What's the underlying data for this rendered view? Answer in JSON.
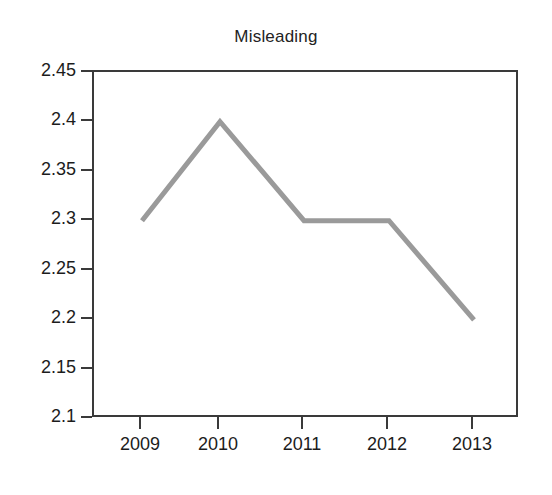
{
  "chart_data": {
    "type": "line",
    "title": "Misleading",
    "xlabel": "",
    "ylabel": "",
    "categories": [
      "2009",
      "2010",
      "2011",
      "2012",
      "2013"
    ],
    "values": [
      2.3,
      2.4,
      2.3,
      2.3,
      2.2
    ],
    "series": [
      {
        "name": "",
        "values": [
          2.3,
          2.4,
          2.3,
          2.3,
          2.2
        ]
      }
    ],
    "ylim": [
      2.1,
      2.45
    ],
    "ytick_labels": [
      "2.45",
      "2.4",
      "2.35",
      "2.3",
      "2.25",
      "2.2",
      "2.15",
      "2.1"
    ],
    "ytick_values": [
      2.45,
      2.4,
      2.35,
      2.3,
      2.25,
      2.2,
      2.15,
      2.1
    ],
    "xtick_labels": [
      "2009",
      "2010",
      "2011",
      "2012",
      "2013"
    ],
    "grid": false,
    "legend": false,
    "legend_position": "none",
    "line_color": "#9a9a9a",
    "axis_color": "#3a3a3a",
    "text_color": "#1c1c1c",
    "background_color": "#ffffff"
  }
}
